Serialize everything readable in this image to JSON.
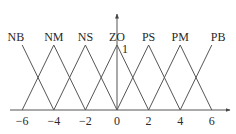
{
  "chart_data": {
    "type": "line",
    "title": "",
    "xlabel": "",
    "ylabel": "",
    "xlim": [
      -6.5,
      7
    ],
    "ylim": [
      0,
      1.5
    ],
    "grid": false,
    "legend_position": "none",
    "x_ticks": [
      -6,
      -4,
      -2,
      0,
      2,
      4,
      6
    ],
    "x_tick_labels": [
      "−6",
      "−4",
      "−2",
      "0",
      "2",
      "4",
      "6"
    ],
    "y_annotation": "1",
    "series": [
      {
        "name": "NB",
        "x": [
          -6,
          -4
        ],
        "y": [
          1,
          0
        ]
      },
      {
        "name": "NM",
        "x": [
          -6,
          -4,
          -2
        ],
        "y": [
          0,
          1,
          0
        ]
      },
      {
        "name": "NS",
        "x": [
          -4,
          -2,
          0
        ],
        "y": [
          0,
          1,
          0
        ]
      },
      {
        "name": "ZO",
        "x": [
          -2,
          0,
          2
        ],
        "y": [
          0,
          1,
          0
        ]
      },
      {
        "name": "PS",
        "x": [
          0,
          2,
          4
        ],
        "y": [
          0,
          1,
          0
        ]
      },
      {
        "name": "PM",
        "x": [
          2,
          4,
          6
        ],
        "y": [
          0,
          1,
          0
        ]
      },
      {
        "name": "PB",
        "x": [
          4,
          6
        ],
        "y": [
          0,
          1
        ]
      }
    ],
    "line_color": "#555555"
  }
}
